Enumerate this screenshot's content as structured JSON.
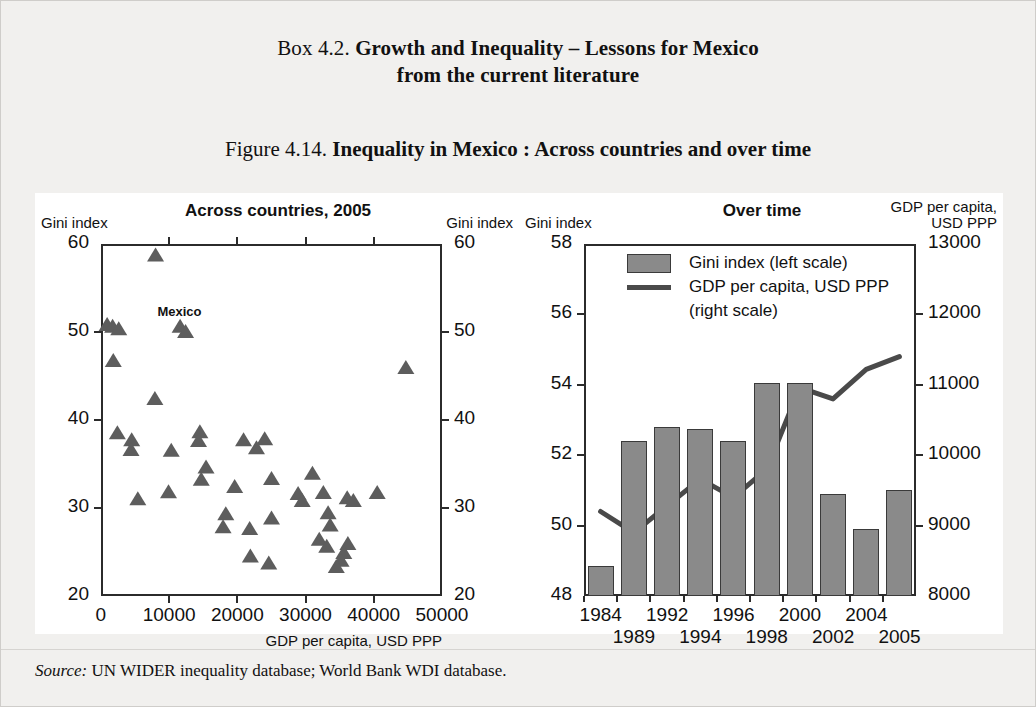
{
  "box": {
    "label": "Box 4.2.",
    "title_line1": "Growth and Inequality – Lessons for Mexico",
    "title_line2": "from the current literature"
  },
  "figure": {
    "label": "Figure 4.14.",
    "title": "Inequality in Mexico : Across countries and over time"
  },
  "source": {
    "label": "Source:",
    "text": "UN WIDER inequality database; World Bank WDI database."
  },
  "colors": {
    "marker": "#5d5d5d",
    "bar_fill": "#8a8a8a",
    "bar_stroke": "#3a3a3a",
    "line": "#4a4a4a",
    "axis": "#2b2b2b",
    "panel": "#ffffff",
    "page": "#f1f0ee"
  },
  "chart_data": [
    {
      "id": "across-countries",
      "type": "scatter",
      "title": "Across countries, 2005",
      "xlabel": "GDP per capita, USD PPP",
      "ylabel_left": "Gini index",
      "ylabel_right": "Gini index",
      "xlim": [
        0,
        50000
      ],
      "ylim": [
        20,
        60
      ],
      "xticks": [
        0,
        10000,
        20000,
        30000,
        40000,
        50000
      ],
      "xtick_labels": [
        "0",
        "10000",
        "20000",
        "30000",
        "40000",
        "50000"
      ],
      "yticks": [
        20,
        30,
        40,
        50,
        60
      ],
      "ytick_labels": [
        "20",
        "30",
        "40",
        "50",
        "60"
      ],
      "grid": false,
      "legend": "none",
      "annotations": [
        {
          "text": "Mexico",
          "x": 11500,
          "y": 51.8
        }
      ],
      "points": [
        {
          "x": 8000,
          "y": 58.7
        },
        {
          "x": 900,
          "y": 50.8
        },
        {
          "x": 1700,
          "y": 50.6
        },
        {
          "x": 2600,
          "y": 50.3
        },
        {
          "x": 11600,
          "y": 50.6
        },
        {
          "x": 12400,
          "y": 50.0
        },
        {
          "x": 1800,
          "y": 46.7
        },
        {
          "x": 44700,
          "y": 45.9
        },
        {
          "x": 7900,
          "y": 42.4
        },
        {
          "x": 2400,
          "y": 38.5
        },
        {
          "x": 4500,
          "y": 37.7
        },
        {
          "x": 4400,
          "y": 36.6
        },
        {
          "x": 10300,
          "y": 36.5
        },
        {
          "x": 14500,
          "y": 38.6
        },
        {
          "x": 14300,
          "y": 37.6
        },
        {
          "x": 20900,
          "y": 37.7
        },
        {
          "x": 24000,
          "y": 37.8
        },
        {
          "x": 22800,
          "y": 36.8
        },
        {
          "x": 15400,
          "y": 34.6
        },
        {
          "x": 14700,
          "y": 33.2
        },
        {
          "x": 19600,
          "y": 32.4
        },
        {
          "x": 25000,
          "y": 33.3
        },
        {
          "x": 31000,
          "y": 33.9
        },
        {
          "x": 5400,
          "y": 31.0
        },
        {
          "x": 9900,
          "y": 31.8
        },
        {
          "x": 28900,
          "y": 31.6
        },
        {
          "x": 29500,
          "y": 30.8
        },
        {
          "x": 32600,
          "y": 31.7
        },
        {
          "x": 36100,
          "y": 31.1
        },
        {
          "x": 37000,
          "y": 30.8
        },
        {
          "x": 40500,
          "y": 31.7
        },
        {
          "x": 18300,
          "y": 29.3
        },
        {
          "x": 33300,
          "y": 29.4
        },
        {
          "x": 17900,
          "y": 27.8
        },
        {
          "x": 21800,
          "y": 27.6
        },
        {
          "x": 25000,
          "y": 28.8
        },
        {
          "x": 33600,
          "y": 28.0
        },
        {
          "x": 32000,
          "y": 26.4
        },
        {
          "x": 33100,
          "y": 25.6
        },
        {
          "x": 36200,
          "y": 25.9
        },
        {
          "x": 35600,
          "y": 24.9
        },
        {
          "x": 21900,
          "y": 24.5
        },
        {
          "x": 35200,
          "y": 24.0
        },
        {
          "x": 24600,
          "y": 23.7
        },
        {
          "x": 34500,
          "y": 23.3
        }
      ]
    },
    {
      "id": "over-time",
      "type": "bar",
      "title": "Over time",
      "ylabel_left": "Gini index",
      "ylabel_right_line1": "GDP per capita,",
      "ylabel_right_line2": "USD PPP",
      "categories": [
        "1984",
        "1989",
        "1992",
        "1994",
        "1996",
        "1998",
        "2000",
        "2002",
        "2004",
        "2005"
      ],
      "ylim_left": [
        48,
        58
      ],
      "yticks_left": [
        48,
        50,
        52,
        54,
        56,
        58
      ],
      "ytick_labels_left": [
        "48",
        "50",
        "52",
        "54",
        "56",
        "58"
      ],
      "ylim_right": [
        8000,
        13000
      ],
      "yticks_right": [
        8000,
        9000,
        10000,
        11000,
        12000,
        13000
      ],
      "ytick_labels_right": [
        "8000",
        "9000",
        "10000",
        "11000",
        "12000",
        "13000"
      ],
      "grid": false,
      "legend_position": "top-left",
      "series": [
        {
          "name": "Gini index (left scale)",
          "kind": "bar",
          "axis": "left",
          "values": [
            48.85,
            52.4,
            52.8,
            52.75,
            52.4,
            54.05,
            54.05,
            50.9,
            49.9,
            51.0
          ]
        },
        {
          "name": "GDP per capita, USD PPP",
          "name_line2": "(right scale)",
          "kind": "line",
          "axis": "right",
          "values": [
            9200,
            8900,
            9280,
            9660,
            9400,
            9800,
            10960,
            10800,
            11220,
            11400
          ]
        }
      ],
      "legend_entries": [
        "Gini index (left scale)",
        "GDP per capita, USD PPP",
        "(right scale)"
      ]
    }
  ]
}
